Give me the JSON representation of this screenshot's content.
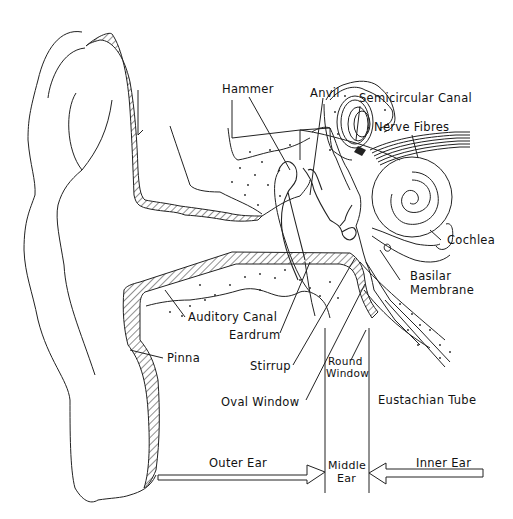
{
  "labels": {
    "hammer": "Hammer",
    "anvil": "Anvil",
    "semicircular_canal": "Semicircular Canal",
    "nerve_fibres": "Nerve Fibres",
    "cochlea": "Cochlea",
    "basilar_membrane_1": "Basilar",
    "basilar_membrane_2": "Membrane",
    "auditory_canal": "Auditory Canal",
    "eardrum": "Eardrum",
    "pinna": "Pinna",
    "stirrup": "Stirrup",
    "round_window_1": "Round",
    "round_window_2": "Window",
    "oval_window": "Oval Window",
    "eustachian_tube": "Eustachian Tube"
  },
  "regions": {
    "outer_ear": "Outer Ear",
    "middle_ear_1": "Middle",
    "middle_ear_2": "Ear",
    "inner_ear": "Inner Ear"
  },
  "colors": {
    "line": "#222222",
    "background": "#ffffff"
  }
}
